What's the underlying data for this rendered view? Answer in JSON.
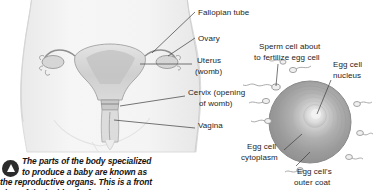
{
  "figure": {
    "title_implicit": "Female reproductive organs and egg cell fertilization",
    "background_color": "#ffffff",
    "text_color": "#1d1d1d",
    "line_color": "#3a3a3a"
  },
  "anatomy_diagram": {
    "name": "female-reproductive-system",
    "body_color": "#f1f1f1",
    "organ_color": "#d8d8d8",
    "labels": [
      {
        "id": "fallopian-tube",
        "text": "Fallopian tube",
        "x": 198,
        "y": 8
      },
      {
        "id": "ovary",
        "text": "Ovary",
        "x": 198,
        "y": 34
      },
      {
        "id": "uterus-1",
        "text": "Uterus",
        "x": 195,
        "y": 60
      },
      {
        "id": "uterus-2",
        "text": "(womb)",
        "x": 195,
        "y": 70
      },
      {
        "id": "cervix-1",
        "text": "Cervix (opening",
        "x": 188,
        "y": 92
      },
      {
        "id": "cervix-2",
        "text": "of womb)",
        "x": 197,
        "y": 102
      },
      {
        "id": "vagina",
        "text": "Vagina",
        "x": 198,
        "y": 124
      }
    ]
  },
  "egg_diagram": {
    "name": "egg-cell-fertilization",
    "egg_outer_color": "#9e9e9e",
    "egg_mid_color": "#b4b4b4",
    "egg_nucleus_color": "#e6e6e6",
    "labels": [
      {
        "id": "sperm-cell-1",
        "text": "Sperm cell about",
        "x": 259,
        "y": 46
      },
      {
        "id": "sperm-cell-2",
        "text": "to fertilize egg cell",
        "x": 254,
        "y": 56
      },
      {
        "id": "egg-nucleus-1",
        "text": "Egg cell",
        "x": 333,
        "y": 64
      },
      {
        "id": "egg-nucleus-2",
        "text": "nucleus",
        "x": 333,
        "y": 74
      },
      {
        "id": "egg-cytoplasm-1",
        "text": "Egg cell",
        "x": 247,
        "y": 146
      },
      {
        "id": "egg-cytoplasm-2",
        "text": "cytoplasm",
        "x": 247,
        "y": 156
      },
      {
        "id": "egg-outer-coat-1",
        "text": "Egg cell's",
        "x": 300,
        "y": 170
      },
      {
        "id": "egg-outer-coat-2",
        "text": "outer coat",
        "x": 300,
        "y": 180
      }
    ]
  },
  "caption": {
    "bullet_icon": "triangle-up-icon",
    "lines": [
      "The parts of the body specialized",
      "to produce a baby are known as",
      "the reproductive organs. This is a front",
      "view of the inside of a female."
    ]
  }
}
